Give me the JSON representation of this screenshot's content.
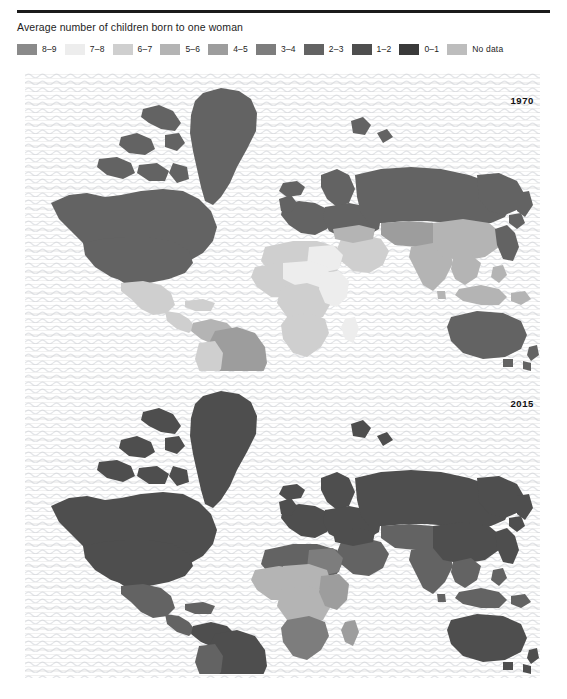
{
  "figure": {
    "title": "Average number of children born to one woman",
    "rule_color": "#1b1b1b"
  },
  "legend": {
    "items": [
      {
        "label": "8–9",
        "color": "#8a8a8a",
        "name": "legend-8-9"
      },
      {
        "label": "7–8",
        "color": "#ededed",
        "name": "legend-7-8"
      },
      {
        "label": "6–7",
        "color": "#cfcfcf",
        "name": "legend-6-7"
      },
      {
        "label": "5–6",
        "color": "#b4b4b4",
        "name": "legend-5-6"
      },
      {
        "label": "4–5",
        "color": "#9d9d9d",
        "name": "legend-4-5"
      },
      {
        "label": "3–4",
        "color": "#7d7d7d",
        "name": "legend-3-4"
      },
      {
        "label": "2–3",
        "color": "#636363",
        "name": "legend-2-3"
      },
      {
        "label": "1–2",
        "color": "#4e4e4e",
        "name": "legend-1-2"
      },
      {
        "label": "0–1",
        "color": "#3a3a3a",
        "name": "legend-0-1"
      },
      {
        "label": "No data",
        "color": "#bdbdbd",
        "name": "legend-no-data"
      }
    ]
  },
  "maps": {
    "panels": [
      {
        "year": "1970",
        "name": "map-panel-1970"
      },
      {
        "year": "2015",
        "name": "map-panel-2015"
      }
    ]
  },
  "chart_data": {
    "type": "map",
    "title": "Average number of children born to one woman",
    "subtype": "choropleth world map, two panels",
    "legend_position": "top",
    "grid": false,
    "xlabel": "",
    "ylabel": "",
    "classes": [
      {
        "range": "8–9",
        "color": "#8a8a8a"
      },
      {
        "range": "7–8",
        "color": "#ededed"
      },
      {
        "range": "6–7",
        "color": "#cfcfcf"
      },
      {
        "range": "5–6",
        "color": "#b4b4b4"
      },
      {
        "range": "4–5",
        "color": "#9d9d9d"
      },
      {
        "range": "3–4",
        "color": "#7d7d7d"
      },
      {
        "range": "2–3",
        "color": "#636363"
      },
      {
        "range": "1–2",
        "color": "#4e4e4e"
      },
      {
        "range": "0–1",
        "color": "#3a3a3a"
      },
      {
        "range": "No data",
        "color": "#bdbdbd"
      }
    ],
    "panels": [
      {
        "year": "1970",
        "regions": [
          {
            "name": "Canada",
            "class": "2–3"
          },
          {
            "name": "Greenland",
            "class": "2–3"
          },
          {
            "name": "United States",
            "class": "2–3"
          },
          {
            "name": "Mexico",
            "class": "6–7"
          },
          {
            "name": "Central America",
            "class": "6–7"
          },
          {
            "name": "Brazil",
            "class": "4–5"
          },
          {
            "name": "Argentina",
            "class": "3–4"
          },
          {
            "name": "Chile",
            "class": "3–4"
          },
          {
            "name": "Colombia",
            "class": "5–6"
          },
          {
            "name": "Peru",
            "class": "6–7"
          },
          {
            "name": "Europe",
            "class": "2–3"
          },
          {
            "name": "Russia",
            "class": "2–3"
          },
          {
            "name": "North Africa",
            "class": "6–7"
          },
          {
            "name": "Libya",
            "class": "7–8"
          },
          {
            "name": "Sahel",
            "class": "7–8"
          },
          {
            "name": "West Africa",
            "class": "6–7"
          },
          {
            "name": "Central Africa",
            "class": "6–7"
          },
          {
            "name": "East Africa",
            "class": "7–8"
          },
          {
            "name": "Southern Africa",
            "class": "6–7"
          },
          {
            "name": "Middle East",
            "class": "6–7"
          },
          {
            "name": "India",
            "class": "5–6"
          },
          {
            "name": "China",
            "class": "5–6"
          },
          {
            "name": "Southeast Asia",
            "class": "5–6"
          },
          {
            "name": "Japan",
            "class": "2–3"
          },
          {
            "name": "Australia",
            "class": "2–3"
          },
          {
            "name": "New Zealand",
            "class": "2–3"
          }
        ]
      },
      {
        "year": "2015",
        "regions": [
          {
            "name": "Canada",
            "class": "1–2"
          },
          {
            "name": "Greenland",
            "class": "1–2"
          },
          {
            "name": "United States",
            "class": "1–2"
          },
          {
            "name": "Mexico",
            "class": "2–3"
          },
          {
            "name": "Central America",
            "class": "2–3"
          },
          {
            "name": "Brazil",
            "class": "1–2"
          },
          {
            "name": "Argentina",
            "class": "2–3"
          },
          {
            "name": "Chile",
            "class": "1–2"
          },
          {
            "name": "Colombia",
            "class": "1–2"
          },
          {
            "name": "Peru",
            "class": "2–3"
          },
          {
            "name": "Europe",
            "class": "1–2"
          },
          {
            "name": "Russia",
            "class": "1–2"
          },
          {
            "name": "North Africa",
            "class": "2–3"
          },
          {
            "name": "Sahel",
            "class": "5–6"
          },
          {
            "name": "West Africa",
            "class": "5–6"
          },
          {
            "name": "Central Africa",
            "class": "5–6"
          },
          {
            "name": "East Africa",
            "class": "4–5"
          },
          {
            "name": "Southern Africa",
            "class": "3–4"
          },
          {
            "name": "Middle East",
            "class": "2–3"
          },
          {
            "name": "India",
            "class": "2–3"
          },
          {
            "name": "China",
            "class": "1–2"
          },
          {
            "name": "Southeast Asia",
            "class": "2–3"
          },
          {
            "name": "Japan",
            "class": "1–2"
          },
          {
            "name": "Australia",
            "class": "1–2"
          },
          {
            "name": "New Zealand",
            "class": "1–2"
          }
        ]
      }
    ]
  }
}
